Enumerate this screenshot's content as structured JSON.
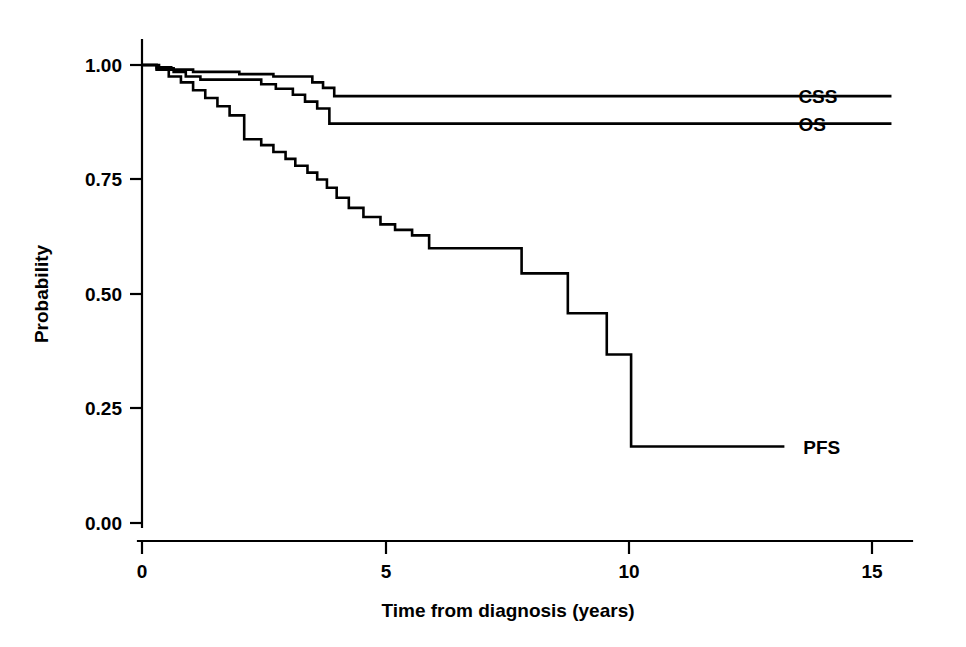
{
  "figure": {
    "background_color": "#ffffff",
    "line_color": "#000000",
    "width": 966,
    "height": 647
  },
  "axes": {
    "x_title": "Time from diagnosis (years)",
    "y_title": "Probability",
    "x_ticks": [
      "0",
      "5",
      "10",
      "15"
    ],
    "y_ticks": [
      "1.00",
      "0.75",
      "0.50",
      "0.25",
      "0.00"
    ]
  },
  "labels": {
    "css": "CSS",
    "os": "OS",
    "pfs": "PFS"
  },
  "chart_data": {
    "type": "line",
    "subtype": "kaplan-meier-step",
    "title": "",
    "xlabel": "Time from diagnosis (years)",
    "ylabel": "Probability",
    "xlim": [
      0,
      16
    ],
    "ylim": [
      0,
      1.0
    ],
    "xticks": [
      0,
      5,
      10,
      15
    ],
    "yticks": [
      0,
      0.25,
      0.5,
      0.75,
      1.0
    ],
    "grid": false,
    "legend": "inline-right-labels",
    "line_color": "#000000",
    "series": [
      {
        "name": "CSS",
        "label": "CSS",
        "label_position": {
          "x": 13.2,
          "y": 0.932
        },
        "points": [
          [
            0.0,
            1.0
          ],
          [
            0.25,
            1.0
          ],
          [
            0.35,
            0.995
          ],
          [
            0.5,
            0.995
          ],
          [
            0.6,
            0.99
          ],
          [
            0.95,
            0.99
          ],
          [
            1.05,
            0.985
          ],
          [
            1.9,
            0.985
          ],
          [
            2.0,
            0.98
          ],
          [
            2.6,
            0.98
          ],
          [
            2.7,
            0.975
          ],
          [
            3.4,
            0.975
          ],
          [
            3.5,
            0.962
          ],
          [
            3.62,
            0.962
          ],
          [
            3.72,
            0.95
          ],
          [
            3.85,
            0.95
          ],
          [
            3.95,
            0.932
          ],
          [
            15.4,
            0.932
          ]
        ]
      },
      {
        "name": "OS",
        "label": "OS",
        "label_position": {
          "x": 13.2,
          "y": 0.872
        },
        "points": [
          [
            0.0,
            1.0
          ],
          [
            0.2,
            1.0
          ],
          [
            0.3,
            0.993
          ],
          [
            0.55,
            0.993
          ],
          [
            0.65,
            0.985
          ],
          [
            0.8,
            0.985
          ],
          [
            0.9,
            0.975
          ],
          [
            1.1,
            0.975
          ],
          [
            1.2,
            0.968
          ],
          [
            2.35,
            0.968
          ],
          [
            2.45,
            0.958
          ],
          [
            2.65,
            0.958
          ],
          [
            2.75,
            0.948
          ],
          [
            3.0,
            0.948
          ],
          [
            3.1,
            0.935
          ],
          [
            3.25,
            0.935
          ],
          [
            3.35,
            0.92
          ],
          [
            3.5,
            0.92
          ],
          [
            3.6,
            0.905
          ],
          [
            3.75,
            0.905
          ],
          [
            3.85,
            0.872
          ],
          [
            15.4,
            0.872
          ]
        ]
      },
      {
        "name": "PFS",
        "label": "PFS",
        "label_position": {
          "x": 13.3,
          "y": 0.167
        },
        "points": [
          [
            0.0,
            1.0
          ],
          [
            0.2,
            1.0
          ],
          [
            0.3,
            0.99
          ],
          [
            0.45,
            0.99
          ],
          [
            0.55,
            0.975
          ],
          [
            0.7,
            0.975
          ],
          [
            0.8,
            0.962
          ],
          [
            0.95,
            0.962
          ],
          [
            1.05,
            0.945
          ],
          [
            1.2,
            0.945
          ],
          [
            1.3,
            0.928
          ],
          [
            1.45,
            0.928
          ],
          [
            1.55,
            0.91
          ],
          [
            1.7,
            0.91
          ],
          [
            1.8,
            0.89
          ],
          [
            2.0,
            0.89
          ],
          [
            2.1,
            0.838
          ],
          [
            2.35,
            0.838
          ],
          [
            2.45,
            0.825
          ],
          [
            2.6,
            0.825
          ],
          [
            2.7,
            0.81
          ],
          [
            2.85,
            0.81
          ],
          [
            2.95,
            0.795
          ],
          [
            3.05,
            0.795
          ],
          [
            3.15,
            0.78
          ],
          [
            3.3,
            0.78
          ],
          [
            3.4,
            0.765
          ],
          [
            3.5,
            0.765
          ],
          [
            3.6,
            0.75
          ],
          [
            3.7,
            0.75
          ],
          [
            3.8,
            0.732
          ],
          [
            3.9,
            0.732
          ],
          [
            4.0,
            0.71
          ],
          [
            4.15,
            0.71
          ],
          [
            4.25,
            0.688
          ],
          [
            4.45,
            0.688
          ],
          [
            4.55,
            0.668
          ],
          [
            4.8,
            0.668
          ],
          [
            4.9,
            0.652
          ],
          [
            5.1,
            0.652
          ],
          [
            5.2,
            0.64
          ],
          [
            5.45,
            0.64
          ],
          [
            5.55,
            0.628
          ],
          [
            5.8,
            0.628
          ],
          [
            5.9,
            0.6
          ],
          [
            7.7,
            0.6
          ],
          [
            7.8,
            0.545
          ],
          [
            8.65,
            0.545
          ],
          [
            8.75,
            0.458
          ],
          [
            9.45,
            0.458
          ],
          [
            9.55,
            0.368
          ],
          [
            10.0,
            0.368
          ],
          [
            10.05,
            0.167
          ],
          [
            13.2,
            0.167
          ]
        ]
      }
    ]
  }
}
